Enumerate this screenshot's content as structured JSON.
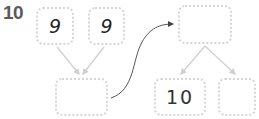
{
  "problem": {
    "number": "10"
  },
  "left_tree": {
    "top_left": "9",
    "top_right": "9",
    "bottom": ""
  },
  "right_tree": {
    "top": "",
    "bottom_left": "10",
    "bottom_right": ""
  },
  "colors": {
    "box_border": "#d6d6d6",
    "connector": "#cfcfcf",
    "arrow": "#444444",
    "number": "#5a5a5a"
  }
}
